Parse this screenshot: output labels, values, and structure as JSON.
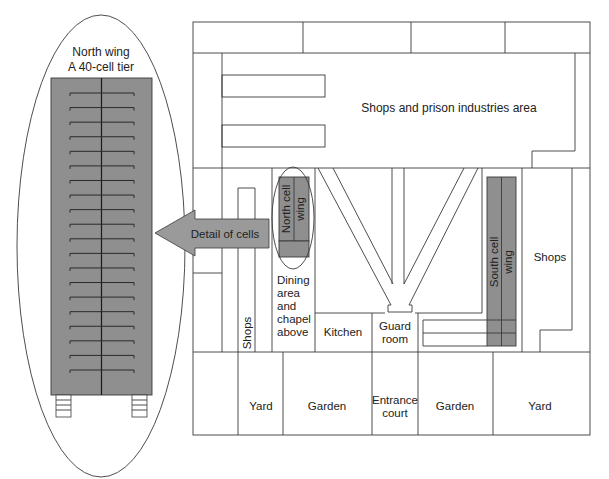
{
  "detail": {
    "title_line1": "North wing",
    "title_line2": "A 40-cell tier",
    "cell_rows": 20,
    "fill_color": "#8f8f8f"
  },
  "arrow": {
    "label": "Detail of cells"
  },
  "plan": {
    "top_area": "Shops and prison industries area",
    "north_wing_line1": "North cell",
    "north_wing_line2": "wing",
    "south_wing_line1": "South cell",
    "south_wing_line2": "wing",
    "shops_left": "Shops",
    "shops_right": "Shops",
    "dining": [
      "Dining",
      "area",
      "and",
      "chapel",
      "above"
    ],
    "kitchen": "Kitchen",
    "guard_line1": "Guard",
    "guard_line2": "room",
    "yard_left": "Yard",
    "garden_left": "Garden",
    "entrance_line1": "Entrance",
    "entrance_line2": "court",
    "garden_right": "Garden",
    "yard_right": "Yard"
  }
}
